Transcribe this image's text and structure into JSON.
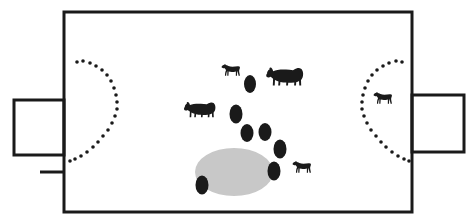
{
  "figure": {
    "canvas": {
      "width": 474,
      "height": 224
    },
    "background_color": "#ffffff",
    "stroke_color": "#1a1a1a",
    "fill_dark": "#1a1a1a",
    "fill_gray": "#c8c8c8"
  },
  "enclosure": {
    "name": "main-enclosure",
    "x": 64,
    "y": 12,
    "width": 348,
    "height": 200,
    "stroke_width": 3,
    "fill": "none"
  },
  "annexes": [
    {
      "name": "left-annex",
      "x": 14,
      "y": 100,
      "width": 50,
      "height": 55,
      "stroke_width": 3
    },
    {
      "name": "right-annex",
      "x": 412,
      "y": 95,
      "width": 52,
      "height": 57,
      "stroke_width": 3
    }
  ],
  "tick_marks": [
    {
      "name": "left-lower-tick",
      "x1": 40,
      "y1": 172,
      "x2": 64,
      "y2": 172,
      "stroke_width": 3
    }
  ],
  "dotted_arcs": [
    {
      "name": "left-dotted-arc",
      "orientation": "bulge-right",
      "dot_radius": 1.8,
      "dot_count": 21,
      "dots": [
        [
          77,
          62
        ],
        [
          83,
          61
        ],
        [
          90,
          63
        ],
        [
          96,
          66
        ],
        [
          102,
          70
        ],
        [
          107,
          75
        ],
        [
          111,
          81
        ],
        [
          114,
          88
        ],
        [
          116,
          95
        ],
        [
          117,
          102
        ],
        [
          117,
          109
        ],
        [
          115,
          116
        ],
        [
          112,
          123
        ],
        [
          108,
          130
        ],
        [
          103,
          136
        ],
        [
          98,
          142
        ],
        [
          93,
          147
        ],
        [
          87,
          152
        ],
        [
          81,
          156
        ],
        [
          75,
          159
        ],
        [
          70,
          161
        ]
      ]
    },
    {
      "name": "right-dotted-arc",
      "orientation": "bulge-left",
      "dot_radius": 1.8,
      "dot_count": 21,
      "dots": [
        [
          402,
          62
        ],
        [
          396,
          61
        ],
        [
          389,
          63
        ],
        [
          383,
          66
        ],
        [
          377,
          70
        ],
        [
          372,
          75
        ],
        [
          368,
          81
        ],
        [
          365,
          88
        ],
        [
          363,
          95
        ],
        [
          362,
          102
        ],
        [
          362,
          109
        ],
        [
          364,
          116
        ],
        [
          367,
          123
        ],
        [
          371,
          130
        ],
        [
          376,
          136
        ],
        [
          381,
          142
        ],
        [
          386,
          147
        ],
        [
          392,
          152
        ],
        [
          398,
          156
        ],
        [
          404,
          159
        ],
        [
          409,
          161
        ]
      ]
    }
  ],
  "gray_ellipse": {
    "name": "gray-basin-ellipse",
    "cx": 234,
    "cy": 172,
    "rx": 39,
    "ry": 24
  },
  "dark_ellipses": [
    {
      "name": "dark-blob-1",
      "cx": 250,
      "cy": 84,
      "rx": 6,
      "ry": 9,
      "rotation": 0
    },
    {
      "name": "dark-blob-2",
      "cx": 236,
      "cy": 114,
      "rx": 6.5,
      "ry": 9.5,
      "rotation": 0
    },
    {
      "name": "dark-blob-3",
      "cx": 247,
      "cy": 133,
      "rx": 6.5,
      "ry": 9,
      "rotation": 0
    },
    {
      "name": "dark-blob-4",
      "cx": 265,
      "cy": 132,
      "rx": 6.5,
      "ry": 9,
      "rotation": 0
    },
    {
      "name": "dark-blob-5",
      "cx": 280,
      "cy": 149,
      "rx": 6.5,
      "ry": 9.5,
      "rotation": 0
    },
    {
      "name": "dark-blob-6",
      "cx": 274,
      "cy": 171,
      "rx": 6.5,
      "ry": 9.5,
      "rotation": 0
    },
    {
      "name": "dark-blob-7",
      "cx": 202,
      "cy": 185,
      "rx": 6.5,
      "ry": 9.5,
      "rotation": 0
    }
  ],
  "animals": [
    {
      "name": "zebra-upper-center",
      "species": "zebra",
      "x": 220,
      "y": 63,
      "scale": 0.62,
      "facing": "left"
    },
    {
      "name": "rhino-upper-right",
      "species": "rhinoceros",
      "x": 265,
      "y": 64,
      "scale": 1.0,
      "facing": "left"
    },
    {
      "name": "rhino-mid-left",
      "species": "rhinoceros",
      "x": 183,
      "y": 99,
      "scale": 0.85,
      "facing": "left"
    },
    {
      "name": "zebra-lower-right",
      "species": "zebra",
      "x": 291,
      "y": 160,
      "scale": 0.62,
      "facing": "left"
    },
    {
      "name": "zebra-right-arc",
      "species": "zebra",
      "x": 372,
      "y": 91,
      "scale": 0.62,
      "facing": "left"
    }
  ],
  "legend": {
    "items": [
      {
        "label": "zebra",
        "symbol": "zebra-silhouette"
      },
      {
        "label": "rhinoceros",
        "symbol": "rhino-silhouette"
      },
      {
        "label": "dark blob",
        "symbol": "filled-ellipse"
      },
      {
        "label": "gray basin",
        "symbol": "gray-ellipse"
      },
      {
        "label": "dotted arc",
        "symbol": "dotted-curve"
      }
    ]
  }
}
